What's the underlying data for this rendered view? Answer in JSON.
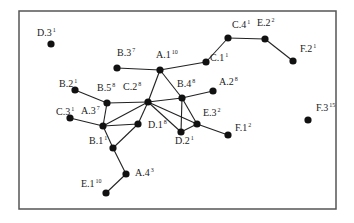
{
  "diagram": {
    "type": "network-graph",
    "frame": {
      "x": 19,
      "y": 11,
      "width": 317,
      "height": 198
    },
    "nodes": [
      {
        "id": "D.3",
        "label": "D.3",
        "sup": "1",
        "x": 51,
        "y": 44,
        "lx": -14,
        "ly": -8
      },
      {
        "id": "B.3",
        "label": "B.3",
        "sup": "7",
        "x": 117,
        "y": 68,
        "lx": 0,
        "ly": -12
      },
      {
        "id": "A.1",
        "label": "A.1",
        "sup": "10",
        "x": 160,
        "y": 70,
        "lx": -4,
        "ly": -12
      },
      {
        "id": "C.1",
        "label": "C.1",
        "sup": "1",
        "x": 206,
        "y": 62,
        "lx": 4,
        "ly": -1
      },
      {
        "id": "C.4",
        "label": "C.4",
        "sup": "1",
        "x": 228,
        "y": 38,
        "lx": 4,
        "ly": -10
      },
      {
        "id": "E.2",
        "label": "E.2",
        "sup": "2",
        "x": 265,
        "y": 39,
        "lx": -8,
        "ly": -13
      },
      {
        "id": "F.2",
        "label": "F.2",
        "sup": "1",
        "x": 293,
        "y": 61,
        "lx": 7,
        "ly": -9
      },
      {
        "id": "B.2",
        "label": "B.2",
        "sup": "1",
        "x": 75,
        "y": 90,
        "lx": -16,
        "ly": -3
      },
      {
        "id": "B.5",
        "label": "B.5",
        "sup": "8",
        "x": 107,
        "y": 103,
        "lx": -10,
        "ly": -12
      },
      {
        "id": "C.2",
        "label": "C.2",
        "sup": "8",
        "x": 148,
        "y": 102,
        "lx": -25,
        "ly": -12
      },
      {
        "id": "B.4",
        "label": "B.4",
        "sup": "8",
        "x": 182,
        "y": 98,
        "lx": -5,
        "ly": -11
      },
      {
        "id": "A.2",
        "label": "A.2",
        "sup": "8",
        "x": 213,
        "y": 91,
        "lx": 6,
        "ly": -6
      },
      {
        "id": "C.3",
        "label": "C.3",
        "sup": "1",
        "x": 70,
        "y": 118,
        "lx": -14,
        "ly": -3
      },
      {
        "id": "A.3",
        "label": "A.3",
        "sup": "7",
        "x": 103,
        "y": 126,
        "lx": -22,
        "ly": -12
      },
      {
        "id": "D.1",
        "label": "D.1",
        "sup": "8",
        "x": 138,
        "y": 124,
        "lx": 10,
        "ly": 4
      },
      {
        "id": "D.2",
        "label": "D.2",
        "sup": "1",
        "x": 181,
        "y": 132,
        "lx": -6,
        "ly": 12
      },
      {
        "id": "E.3",
        "label": "E.3",
        "sup": "2",
        "x": 197,
        "y": 124,
        "lx": 6,
        "ly": -8
      },
      {
        "id": "F.1",
        "label": "F.1",
        "sup": "2",
        "x": 228,
        "y": 135,
        "lx": 7,
        "ly": -4
      },
      {
        "id": "F.3",
        "label": "F.3",
        "sup": "15",
        "x": 308,
        "y": 120,
        "lx": 8,
        "ly": -9
      },
      {
        "id": "B.1",
        "label": "B.1",
        "sup": "1",
        "x": 113,
        "y": 148,
        "lx": -24,
        "ly": -4
      },
      {
        "id": "A.4",
        "label": "A.4",
        "sup": "3",
        "x": 126,
        "y": 174,
        "lx": 9,
        "ly": 2
      },
      {
        "id": "E.1",
        "label": "E.1",
        "sup": "10",
        "x": 106,
        "y": 193,
        "lx": -25,
        "ly": -6
      }
    ],
    "edges": [
      [
        "B.3",
        "A.1"
      ],
      [
        "A.1",
        "C.1"
      ],
      [
        "C.1",
        "C.4"
      ],
      [
        "C.4",
        "E.2"
      ],
      [
        "E.2",
        "F.2"
      ],
      [
        "A.1",
        "C.2"
      ],
      [
        "A.1",
        "B.4"
      ],
      [
        "B.2",
        "B.5"
      ],
      [
        "B.5",
        "C.2"
      ],
      [
        "B.5",
        "A.3"
      ],
      [
        "C.2",
        "B.4"
      ],
      [
        "C.2",
        "D.2"
      ],
      [
        "C.2",
        "E.3"
      ],
      [
        "C.2",
        "D.1"
      ],
      [
        "C.2",
        "A.3"
      ],
      [
        "B.4",
        "A.2"
      ],
      [
        "B.4",
        "D.2"
      ],
      [
        "B.4",
        "E.3"
      ],
      [
        "D.2",
        "E.3"
      ],
      [
        "E.3",
        "F.1"
      ],
      [
        "C.3",
        "A.3"
      ],
      [
        "A.3",
        "D.1"
      ],
      [
        "A.3",
        "B.1"
      ],
      [
        "B.1",
        "D.1"
      ],
      [
        "B.1",
        "A.4"
      ],
      [
        "A.4",
        "E.1"
      ]
    ],
    "colors": {
      "node": "#111111",
      "edge": "#222222",
      "frame": "#555555",
      "background": "#ffffff"
    }
  }
}
